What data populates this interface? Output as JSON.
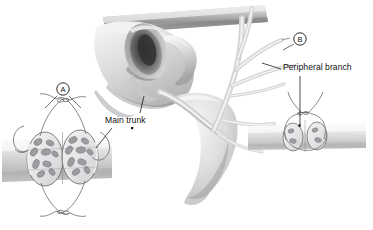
{
  "figure": {
    "title_visible": false,
    "background_color": "#ffffff",
    "ink_color": "#111111",
    "style": "grayscale medical line-and-wash illustration"
  },
  "labels": {
    "main_trunk": "Main trunk",
    "peripheral_branch": "Peripheral branch"
  },
  "markers": {
    "a": "A",
    "b": "B"
  },
  "insets": {
    "a": {
      "marker": "A",
      "description": "nerve stump coaptation with many fascicles",
      "fascicle_count_left": 9,
      "fascicle_count_right": 9,
      "suture_knots": 2
    },
    "b": {
      "marker": "B",
      "description": "small peripheral nerve coaptation with few fascicles",
      "fascicle_count_left": 2,
      "fascicle_count_right": 2,
      "suture_knots": 1
    }
  },
  "colors": {
    "nerve_light": "#e9e9ea",
    "nerve_mid": "#c9cacb",
    "nerve_dark": "#8f9193",
    "tissue_light": "#efefef",
    "tissue_mid": "#c6c6c7",
    "tissue_dark": "#7c7d7f",
    "fascicle": "#9b9da0",
    "suture": "#6f7173",
    "outline": "#5c5e60",
    "canal_shadow": "#3a3b3d"
  }
}
